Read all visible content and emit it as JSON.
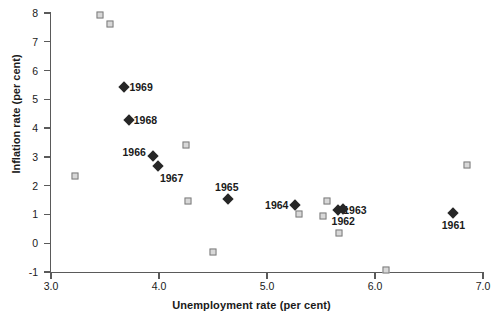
{
  "chart_data": {
    "type": "scatter",
    "title": "",
    "xlabel": "Unemployment rate (per cent)",
    "ylabel": "Inflation rate (per cent)",
    "xlim": [
      3.0,
      7.0
    ],
    "ylim": [
      -1,
      8
    ],
    "xticks": [
      "3.0",
      "4.0",
      "5.0",
      "6.0",
      "7.0"
    ],
    "xtick_values": [
      3.0,
      4.0,
      5.0,
      6.0,
      7.0
    ],
    "yticks": [
      "8",
      "7",
      "6",
      "5",
      "4",
      "3",
      "2",
      "1",
      "0",
      "-1"
    ],
    "ytick_values": [
      8,
      7,
      6,
      5,
      4,
      3,
      2,
      1,
      0,
      -1
    ],
    "grid": false,
    "legend": null,
    "series": [
      {
        "name": "labelled-years",
        "marker": "diamond",
        "color": "#262626",
        "points": [
          {
            "label": "1969",
            "x": 3.68,
            "y": 5.42,
            "label_pos": "right"
          },
          {
            "label": "1968",
            "x": 3.72,
            "y": 4.28,
            "label_pos": "right"
          },
          {
            "label": "1966",
            "x": 3.94,
            "y": 3.03,
            "label_pos": "upper-left"
          },
          {
            "label": "1967",
            "x": 3.99,
            "y": 2.7,
            "label_pos": "lower-right"
          },
          {
            "label": "1965",
            "x": 4.64,
            "y": 1.55,
            "label_pos": "above"
          },
          {
            "label": "1964",
            "x": 5.26,
            "y": 1.32,
            "label_pos": "left"
          },
          {
            "label": "1963",
            "x": 5.66,
            "y": 1.16,
            "label_pos": "right"
          },
          {
            "label": "1962",
            "x": 5.7,
            "y": 1.2,
            "label_pos": "below"
          },
          {
            "label": "1961",
            "x": 6.72,
            "y": 1.05,
            "label_pos": "below"
          }
        ]
      },
      {
        "name": "unlabelled-observations",
        "marker": "square",
        "color": "#d8d8d8",
        "points": [
          {
            "x": 3.45,
            "y": 7.93
          },
          {
            "x": 3.55,
            "y": 7.62
          },
          {
            "x": 3.22,
            "y": 2.35
          },
          {
            "x": 4.25,
            "y": 3.4
          },
          {
            "x": 4.27,
            "y": 1.47
          },
          {
            "x": 4.5,
            "y": -0.3
          },
          {
            "x": 5.3,
            "y": 1.0
          },
          {
            "x": 5.56,
            "y": 1.45
          },
          {
            "x": 5.52,
            "y": 0.95
          },
          {
            "x": 5.67,
            "y": 0.35
          },
          {
            "x": 6.1,
            "y": -0.93
          },
          {
            "x": 6.85,
            "y": 2.72
          }
        ]
      }
    ]
  }
}
